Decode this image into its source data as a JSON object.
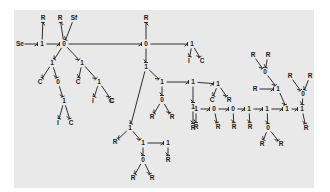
{
  "diagram": {
    "type": "bond-graph",
    "background": "#e9e9e9",
    "ink": "#1a1a1a",
    "nodes": [
      {
        "id": "se",
        "label": "Se",
        "x": 20,
        "y": 44
      },
      {
        "id": "j1a",
        "label": "1",
        "x": 42,
        "y": 44
      },
      {
        "id": "r1",
        "label": "R",
        "x": 43,
        "y": 18
      },
      {
        "id": "j0a",
        "label": "0",
        "x": 64,
        "y": 44
      },
      {
        "id": "r2",
        "label": "R",
        "x": 60,
        "y": 18
      },
      {
        "id": "sf",
        "label": "Sf",
        "x": 74,
        "y": 18
      },
      {
        "id": "j1b",
        "label": "1",
        "x": 52,
        "y": 63
      },
      {
        "id": "c1",
        "label": "C",
        "x": 40,
        "y": 82
      },
      {
        "id": "j0b",
        "label": "0",
        "x": 58,
        "y": 82
      },
      {
        "id": "j1c",
        "label": "1",
        "x": 64,
        "y": 101
      },
      {
        "id": "i1",
        "label": "I",
        "x": 58,
        "y": 123
      },
      {
        "id": "c2",
        "label": "C",
        "x": 71,
        "y": 123
      },
      {
        "id": "j1d",
        "label": "1",
        "x": 82,
        "y": 63
      },
      {
        "id": "c3",
        "label": "C",
        "x": 78,
        "y": 82
      },
      {
        "id": "j1e",
        "label": "1",
        "x": 99,
        "y": 82
      },
      {
        "id": "i2",
        "label": "I",
        "x": 93,
        "y": 101
      },
      {
        "id": "c4",
        "label": "C",
        "x": 112,
        "y": 101
      },
      {
        "id": "r3",
        "label": "R",
        "x": 146,
        "y": 18
      },
      {
        "id": "j0c",
        "label": "0",
        "x": 146,
        "y": 44
      },
      {
        "id": "j1f",
        "label": "1",
        "x": 192,
        "y": 44
      },
      {
        "id": "i3",
        "label": "I",
        "x": 189,
        "y": 61
      },
      {
        "id": "c5",
        "label": "C",
        "x": 202,
        "y": 61
      },
      {
        "id": "j1g",
        "label": "1",
        "x": 146,
        "y": 67
      },
      {
        "id": "c6",
        "label": "C",
        "x": 111,
        "y": 101
      },
      {
        "id": "j1h",
        "label": "1",
        "x": 162,
        "y": 82
      },
      {
        "id": "j1i",
        "label": "1",
        "x": 193,
        "y": 82
      },
      {
        "id": "j0d",
        "label": "0",
        "x": 162,
        "y": 100
      },
      {
        "id": "r4",
        "label": "R",
        "x": 152,
        "y": 117
      },
      {
        "id": "r5",
        "label": "R",
        "x": 172,
        "y": 117
      },
      {
        "id": "j1j",
        "label": "1",
        "x": 193,
        "y": 107
      },
      {
        "id": "r6",
        "label": "R",
        "x": 193,
        "y": 128
      },
      {
        "id": "j1k",
        "label": "1",
        "x": 130,
        "y": 128
      },
      {
        "id": "r7",
        "label": "R",
        "x": 115,
        "y": 142
      },
      {
        "id": "j1l",
        "label": "1",
        "x": 143,
        "y": 143
      },
      {
        "id": "j1m",
        "label": "1",
        "x": 168,
        "y": 143
      },
      {
        "id": "r8",
        "label": "R",
        "x": 168,
        "y": 160
      },
      {
        "id": "j0e",
        "label": "0",
        "x": 143,
        "y": 160
      },
      {
        "id": "r9",
        "label": "R",
        "x": 133,
        "y": 178
      },
      {
        "id": "r10",
        "label": "R",
        "x": 152,
        "y": 178
      },
      {
        "id": "j1n",
        "label": "1",
        "x": 218,
        "y": 84
      },
      {
        "id": "c7",
        "label": "C",
        "x": 212,
        "y": 100
      },
      {
        "id": "r11",
        "label": "R",
        "x": 229,
        "y": 100
      },
      {
        "id": "j1o",
        "label": "1",
        "x": 196,
        "y": 109
      },
      {
        "id": "j0f",
        "label": "0",
        "x": 214,
        "y": 109
      },
      {
        "id": "j0g",
        "label": "0",
        "x": 233,
        "y": 109
      },
      {
        "id": "j1p",
        "label": "1",
        "x": 249,
        "y": 109
      },
      {
        "id": "j1q",
        "label": "1",
        "x": 267,
        "y": 109
      },
      {
        "id": "j1r",
        "label": "1",
        "x": 287,
        "y": 109
      },
      {
        "id": "j1s",
        "label": "1",
        "x": 302,
        "y": 109
      },
      {
        "id": "rb1",
        "label": "R",
        "x": 196,
        "y": 127
      },
      {
        "id": "rb2",
        "label": "R",
        "x": 218,
        "y": 127
      },
      {
        "id": "rb3",
        "label": "R",
        "x": 234,
        "y": 127
      },
      {
        "id": "rb4",
        "label": "R",
        "x": 250,
        "y": 127
      },
      {
        "id": "j0h",
        "label": "0",
        "x": 268,
        "y": 128
      },
      {
        "id": "rb5",
        "label": "R",
        "x": 262,
        "y": 144
      },
      {
        "id": "rb6",
        "label": "R",
        "x": 281,
        "y": 144
      },
      {
        "id": "rb7",
        "label": "R",
        "x": 306,
        "y": 128
      },
      {
        "id": "j1t",
        "label": "1",
        "x": 278,
        "y": 89
      },
      {
        "id": "rm1",
        "label": "R",
        "x": 255,
        "y": 89
      },
      {
        "id": "j0i",
        "label": "0",
        "x": 265,
        "y": 72
      },
      {
        "id": "rt1",
        "label": "R",
        "x": 253,
        "y": 55
      },
      {
        "id": "rt2",
        "label": "R",
        "x": 268,
        "y": 55
      },
      {
        "id": "j0j",
        "label": "0",
        "x": 303,
        "y": 94
      },
      {
        "id": "rt3",
        "label": "R",
        "x": 290,
        "y": 76
      },
      {
        "id": "rt4",
        "label": "R",
        "x": 310,
        "y": 76
      }
    ],
    "bonds": [
      [
        "se",
        "j1a"
      ],
      [
        "j1a",
        "r1"
      ],
      [
        "j1a",
        "j0a"
      ],
      [
        "j0a",
        "r2"
      ],
      [
        "sf",
        "j0a"
      ],
      [
        "j0a",
        "j1b"
      ],
      [
        "j1b",
        "c1"
      ],
      [
        "j1b",
        "j0b"
      ],
      [
        "j0b",
        "j1c"
      ],
      [
        "j1c",
        "i1"
      ],
      [
        "j1c",
        "c2"
      ],
      [
        "j0a",
        "j1d"
      ],
      [
        "j1d",
        "c3"
      ],
      [
        "j1d",
        "j1e"
      ],
      [
        "j1e",
        "i2"
      ],
      [
        "j1e",
        "c4"
      ],
      [
        "j0a",
        "j0c"
      ],
      [
        "j0c",
        "r3"
      ],
      [
        "j0c",
        "j1f"
      ],
      [
        "j1f",
        "i3"
      ],
      [
        "j1f",
        "c5"
      ],
      [
        "j0c",
        "j1g"
      ],
      [
        "j1g",
        "j1h"
      ],
      [
        "j1h",
        "j0d"
      ],
      [
        "j0d",
        "r4"
      ],
      [
        "j0d",
        "r5"
      ],
      [
        "j1h",
        "j1i"
      ],
      [
        "j1i",
        "j1j"
      ],
      [
        "j1j",
        "r6"
      ],
      [
        "j1g",
        "j1k"
      ],
      [
        "j1k",
        "r7"
      ],
      [
        "j1k",
        "j1l"
      ],
      [
        "j1l",
        "j1m"
      ],
      [
        "j1m",
        "r8"
      ],
      [
        "j1l",
        "j0e"
      ],
      [
        "j0e",
        "r9"
      ],
      [
        "j0e",
        "r10"
      ],
      [
        "j1i",
        "j1n"
      ],
      [
        "j1n",
        "c7"
      ],
      [
        "j1n",
        "r11"
      ],
      [
        "j1o",
        "j0f"
      ],
      [
        "j0f",
        "j0g"
      ],
      [
        "j0g",
        "j1p"
      ],
      [
        "j1p",
        "j1q"
      ],
      [
        "j1q",
        "j1r"
      ],
      [
        "j1r",
        "j1s"
      ],
      [
        "j1o",
        "rb1"
      ],
      [
        "j0f",
        "rb2"
      ],
      [
        "j0g",
        "rb3"
      ],
      [
        "j1p",
        "rb4"
      ],
      [
        "j1q",
        "j0h"
      ],
      [
        "j0h",
        "rb5"
      ],
      [
        "j0h",
        "rb6"
      ],
      [
        "j1s",
        "rb7"
      ],
      [
        "j1t",
        "j1r"
      ],
      [
        "rm1",
        "j1t"
      ],
      [
        "j0i",
        "j1t"
      ],
      [
        "rt1",
        "j0i"
      ],
      [
        "rt2",
        "j0i"
      ],
      [
        "j0j",
        "j1s"
      ],
      [
        "rt3",
        "j0j"
      ],
      [
        "rt4",
        "j0j"
      ]
    ]
  }
}
